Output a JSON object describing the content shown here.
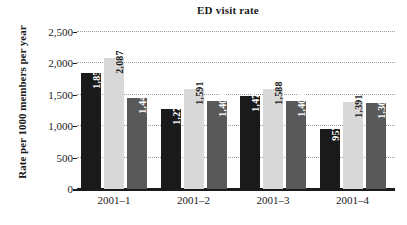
{
  "chart_data": {
    "type": "bar",
    "title": "ED visit rate",
    "xlabel": "",
    "ylabel": "Rate per 1000 members per year",
    "categories": [
      "2001–1",
      "2001–2",
      "2001–3",
      "2001–4"
    ],
    "series": [
      {
        "name": "series-1",
        "color": "#1a1a1a",
        "values": [
          1853,
          1273,
          1476,
          957
        ],
        "labels": [
          "1,853",
          "1,273",
          "1,476",
          "957"
        ]
      },
      {
        "name": "series-2",
        "color": "#d8d8d8",
        "values": [
          2087,
          1591,
          1588,
          1391
        ],
        "labels": [
          "2,087",
          "1,591",
          "1,588",
          "1,391"
        ]
      },
      {
        "name": "series-3",
        "color": "#595959",
        "values": [
          1442,
          1404,
          1404,
          1365
        ],
        "labels": [
          "1,442",
          "1,404",
          "1,404",
          "1,365"
        ]
      }
    ],
    "ylim": [
      0,
      2500
    ],
    "yticks": [
      0,
      500,
      1000,
      1500,
      2000,
      2500
    ],
    "ytick_labels": [
      "0",
      "500",
      "1,000",
      "1,500",
      "2,000",
      "2,500"
    ],
    "grid": true,
    "grid_style": "dotted",
    "legend": "none"
  }
}
